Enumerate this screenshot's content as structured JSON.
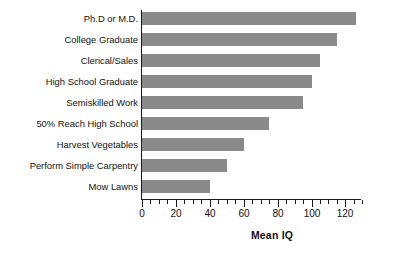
{
  "chart_data": {
    "type": "bar",
    "orientation": "horizontal",
    "title": "",
    "xlabel": "Mean IQ",
    "ylabel": "",
    "xlim": [
      0,
      130
    ],
    "grid": false,
    "legend": null,
    "bar_color": "#8a8a8a",
    "axis_color": "#1a1a1a",
    "xticks": [
      0,
      20,
      40,
      60,
      80,
      100,
      120
    ],
    "xtick_labels": [
      "0",
      "20",
      "40",
      "60",
      "80",
      "100",
      "120"
    ],
    "minor_tick_interval": 5,
    "categories": [
      "Ph.D or M.D.",
      "College Graduate",
      "Clerical/Sales",
      "High School Graduate",
      "Semiskilled Work",
      "50% Reach High School",
      "Harvest Vegetables",
      "Perform Simple Carpentry",
      "Mow Lawns"
    ],
    "values": [
      126,
      115,
      105,
      100,
      95,
      75,
      60,
      50,
      40
    ]
  }
}
